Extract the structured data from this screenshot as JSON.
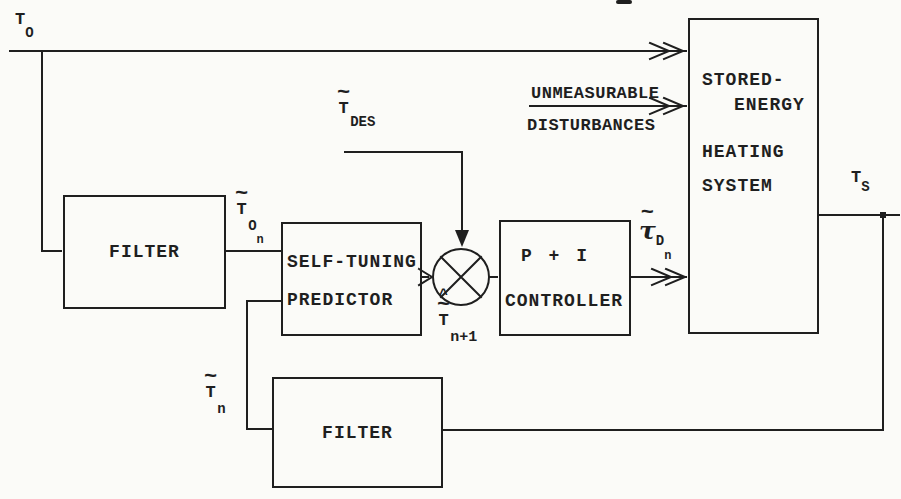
{
  "colors": {
    "ink": "#1f1f1f",
    "paper": "#fbfbf8"
  },
  "blocks": {
    "filter_outdoor": {
      "label": "FILTER"
    },
    "predictor": {
      "line1": "SELF-TUNING",
      "line2": "PREDICTOR"
    },
    "controller": {
      "line1": "P + I",
      "line2": "CONTROLLER"
    },
    "heating_system": {
      "line1": "STORED-",
      "line2": "ENERGY",
      "line3": "HEATING",
      "line4": "SYSTEM"
    },
    "filter_feedback": {
      "label": "FILTER"
    }
  },
  "labels": {
    "t_outdoor": {
      "main": "T",
      "sub": "O"
    },
    "t_desired": {
      "tilde": "~",
      "main": "T",
      "sub": "DES"
    },
    "disturbances": {
      "line1": "UNMEASURABLE",
      "line2": "DISTURBANCES"
    },
    "t_outdoor_filtered": {
      "tilde": "~",
      "main": "T",
      "sub": "O",
      "subsub": "n"
    },
    "t_predicted": {
      "hat": "^",
      "tilde": "~",
      "main": "T",
      "sub": "n+1"
    },
    "tau_demand": {
      "tilde": "~",
      "main": "τ",
      "sub": "D",
      "subsub": "n"
    },
    "t_supply": {
      "main": "T",
      "sub": "S"
    },
    "t_feedback": {
      "tilde": "~",
      "main": "T",
      "sub": "n"
    }
  }
}
